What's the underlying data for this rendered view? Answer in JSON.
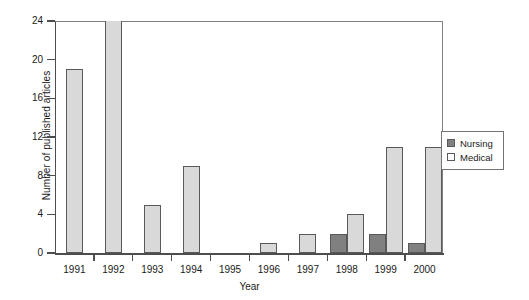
{
  "chart_data": {
    "type": "bar",
    "title": "",
    "xlabel": "Year",
    "ylabel": "Number of published articles",
    "categories": [
      "1991",
      "1992",
      "1993",
      "1994",
      "1995",
      "1996",
      "1997",
      "1998",
      "1999",
      "2000"
    ],
    "series": [
      {
        "name": "Nursing",
        "color": "#808080",
        "values": [
          0,
          0,
          0,
          0,
          0,
          0,
          0,
          2,
          2,
          1
        ]
      },
      {
        "name": "Medical",
        "color": "#d9d9d9",
        "values": [
          19,
          24,
          5,
          9,
          0,
          1,
          2,
          4,
          11,
          11
        ]
      }
    ],
    "ylim": [
      0,
      24
    ],
    "yticks": [
      0,
      4,
      8,
      12,
      16,
      20,
      24
    ],
    "ytick_labels": [
      "0",
      "4",
      "8",
      "12",
      "16",
      "20",
      "24"
    ],
    "grid": false,
    "legend_position": "right"
  },
  "legend": {
    "entries": [
      {
        "label": "Nursing",
        "swatch": "nursing"
      },
      {
        "label": "Medical",
        "swatch": "medical"
      }
    ]
  }
}
